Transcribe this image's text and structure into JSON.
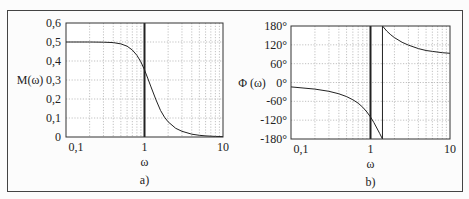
{
  "chart_data": [
    {
      "type": "line",
      "panel_label": "a)",
      "title": "",
      "xlabel": "ω",
      "ylabel": "M(ω)",
      "xscale": "log",
      "xlim": [
        0.1,
        10
      ],
      "ylim": [
        0,
        0.6
      ],
      "x_tick_labels": [
        "0,1",
        "1",
        "10"
      ],
      "y_tick_labels": [
        "0",
        "0,1",
        "0,2",
        "0,3",
        "0,4",
        "0,5",
        "0,6"
      ],
      "grid": true,
      "vertical_markers": [
        {
          "x": 1,
          "style": "thick"
        }
      ],
      "series": [
        {
          "name": "M(ω)",
          "x": [
            0.1,
            0.2,
            0.3,
            0.4,
            0.5,
            0.6,
            0.7,
            0.8,
            0.9,
            1.0,
            1.1,
            1.2,
            1.4,
            1.6,
            1.8,
            2.0,
            2.5,
            3,
            4,
            5,
            6,
            8,
            10
          ],
          "values": [
            0.5,
            0.5,
            0.499,
            0.497,
            0.49,
            0.478,
            0.458,
            0.43,
            0.395,
            0.353,
            0.31,
            0.268,
            0.195,
            0.14,
            0.104,
            0.08,
            0.046,
            0.03,
            0.015,
            0.009,
            0.006,
            0.003,
            0.002
          ]
        }
      ]
    },
    {
      "type": "line",
      "panel_label": "b)",
      "title": "",
      "xlabel": "ω",
      "ylabel": "Φ (ω)",
      "xscale": "log",
      "xlim": [
        0.1,
        10
      ],
      "ylim": [
        -180,
        180
      ],
      "x_tick_labels": [
        "0,1",
        "1",
        "10"
      ],
      "y_tick_labels": [
        "-180°",
        "-120°",
        "-60°",
        "0°",
        "60°",
        "120°",
        "180°"
      ],
      "grid": true,
      "vertical_markers": [
        {
          "x": 1,
          "style": "thick"
        },
        {
          "x": 1.414,
          "style": "thin"
        }
      ],
      "series": [
        {
          "name": "Φ(ω) branch 1",
          "x": [
            0.1,
            0.2,
            0.3,
            0.4,
            0.5,
            0.6,
            0.7,
            0.8,
            0.9,
            1.0,
            1.1,
            1.2,
            1.3,
            1.414
          ],
          "values": [
            -14,
            -21,
            -28,
            -36,
            -45,
            -55,
            -66,
            -79,
            -94,
            -110,
            -127,
            -145,
            -162,
            -180
          ]
        },
        {
          "name": "Φ(ω) branch 2",
          "x": [
            1.414,
            1.6,
            1.8,
            2.0,
            2.5,
            3,
            4,
            5,
            6,
            8,
            10
          ],
          "values": [
            180,
            164,
            152,
            143,
            128,
            119,
            108,
            102,
            99,
            95,
            93
          ]
        }
      ]
    }
  ]
}
